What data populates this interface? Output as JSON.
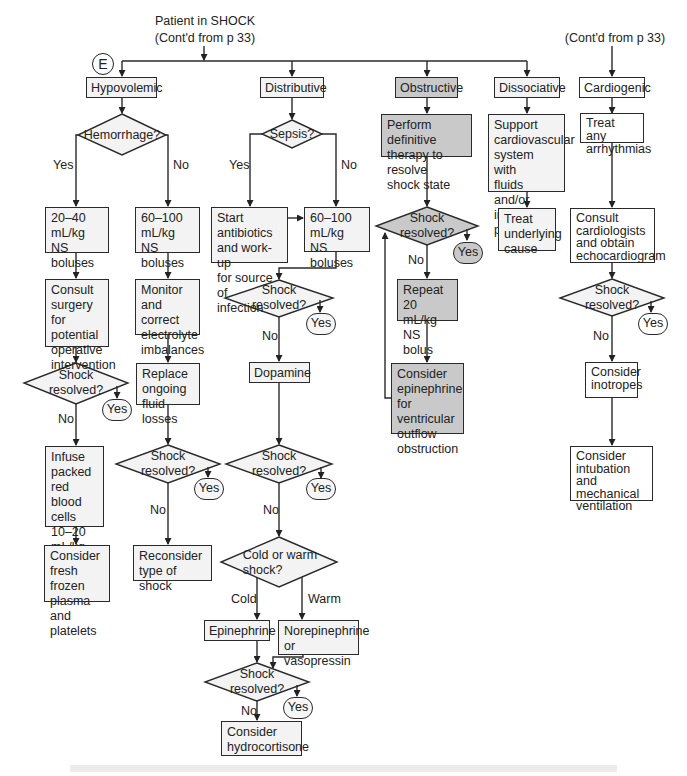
{
  "header": {
    "title": "Patient in SHOCK",
    "subtitle": "(Cont'd from p 33)",
    "right_subtitle": "(Cont'd from p 33)",
    "marker": "E"
  },
  "colors": {
    "box_fill": "#f3f3f3",
    "obstructive_fill": "#c9c9c9",
    "line": "#2a2a2a"
  },
  "columns": {
    "hypovolemic": {
      "title": "Hypovolemic",
      "question": "Hemorrhage?",
      "yes_label": "Yes",
      "no_label": "No",
      "yes_branch": {
        "step1": "20–40\nmL/kg\nNS boluses",
        "step2": "Consult\nsurgery for\npotential\noperative\nintervention",
        "check": "Shock resolved?",
        "check_yes": "Yes",
        "check_no": "No",
        "step3": "Infuse\npacked\nred blood\ncells\n10–20\nmL/kg",
        "step4": "Consider\nfresh frozen\nplasma and\nplatelets"
      },
      "no_branch": {
        "step1": "60–100\nmL/kg\nNS boluses",
        "step2": "Monitor\nand correct\nelectrolyte\nimbalances",
        "step3": "Replace\nongoing\nfluid losses",
        "check": "Shock resolved?",
        "check_yes": "Yes",
        "check_no": "No",
        "step4": "Reconsider\ntype of shock"
      }
    },
    "distributive": {
      "title": "Distributive",
      "question": "Sepsis?",
      "yes_label": "Yes",
      "no_label": "No",
      "antibiotics": "Start antibiotics\nand work-up\nfor source of\ninfection",
      "fluids": "60–100\nmL/kg\nNS boluses",
      "check1": "Shock resolved?",
      "check1_yes": "Yes",
      "check1_no": "No",
      "dopamine": "Dopamine",
      "check2": "Shock resolved?",
      "check2_yes": "Yes",
      "check2_no": "No",
      "cold_warm": "Cold or warm\nshock?",
      "cold_label": "Cold",
      "warm_label": "Warm",
      "epinephrine": "Epinephrine",
      "norepinephrine": "Norepinephrine\nor vasopressin",
      "check3": "Shock resolved?",
      "check3_yes": "Yes",
      "check3_no": "No",
      "hydrocortisone": "Consider\nhydrocortisone"
    },
    "obstructive": {
      "title": "Obstructive",
      "therapy": "Perform definitive\ntherapy to resolve\nshock state",
      "check": "Shock resolved?",
      "check_yes": "Yes",
      "check_no": "No",
      "repeat": "Repeat 20\nmL/kg\nNS bolus",
      "epinephrine": "Consider\nepinephrine\nfor ventricular\noutflow\nobstruction"
    },
    "dissociative": {
      "title": "Dissociative",
      "support": "Support\ncardiovascular\nsystem with\nfluids and/or\ninotropes/\npressors",
      "treat": "Treat\nunderlying\ncause"
    },
    "cardiogenic": {
      "title": "Cardiogenic",
      "arrhythmias": "Treat any\narrhythmias",
      "consult": "Consult\ncardiologists\nand obtain\nechocardiogram",
      "check": "Shock resolved?",
      "check_yes": "Yes",
      "check_no": "No",
      "inotropes": "Consider\ninotropes",
      "intubation": "Consider\nintubation\nand mechanical\nventilation"
    }
  }
}
